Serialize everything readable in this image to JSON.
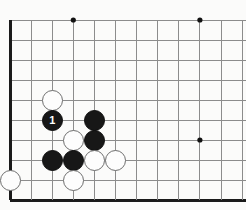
{
  "board": {
    "type": "go-board-diagram",
    "description": "Go (Weiqi) board corner diagram showing lower-left corner with a marked move",
    "background_color": "#fbfbfa",
    "line_color": "#8c8c8c",
    "edge_color": "#1a1a1a",
    "star_point_color": "#111111",
    "geometry": {
      "origin_x": 10,
      "origin_y": 20,
      "col_spacing": 21.1,
      "row_spacing": 20,
      "cols": 12,
      "rows": 10,
      "stone_diameter": 21,
      "edge_line_width": 3,
      "grid_line_width": 1,
      "star_radius": 2.6
    },
    "edges": [
      "left",
      "bottom"
    ],
    "star_points": [
      {
        "col": 3,
        "row": 0
      },
      {
        "col": 9,
        "row": 0
      },
      {
        "col": 9,
        "row": 6
      }
    ],
    "stones": [
      {
        "color": "white",
        "col": 2,
        "row": 4,
        "label": ""
      },
      {
        "color": "black",
        "col": 2,
        "row": 5,
        "label": "1"
      },
      {
        "color": "black",
        "col": 4,
        "row": 5,
        "label": ""
      },
      {
        "color": "black",
        "col": 4,
        "row": 6,
        "label": ""
      },
      {
        "color": "white",
        "col": 3,
        "row": 6,
        "label": ""
      },
      {
        "color": "black",
        "col": 2,
        "row": 7,
        "label": ""
      },
      {
        "color": "black",
        "col": 3,
        "row": 7,
        "label": ""
      },
      {
        "color": "white",
        "col": 4,
        "row": 7,
        "label": ""
      },
      {
        "color": "white",
        "col": 5,
        "row": 7,
        "label": ""
      },
      {
        "color": "white",
        "col": 0,
        "row": 8,
        "label": ""
      },
      {
        "color": "white",
        "col": 3,
        "row": 8,
        "label": ""
      }
    ],
    "move_labels": [
      "1"
    ]
  }
}
